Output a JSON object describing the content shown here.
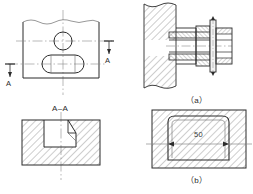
{
  "sheet": {
    "width": 253,
    "height": 194,
    "background": "#ffffff",
    "line_color": "#2b2b2b",
    "thin_line_color": "#6b6b6b",
    "center_line_color": "#8a8a8a",
    "hatch_color": "#555555"
  },
  "views": {
    "top_left": {
      "name": "front-view-with-section-marks",
      "section_arrow_labels": [
        "A",
        "A"
      ],
      "features": [
        "circular-hole",
        "obround-slot",
        "break-line-top"
      ]
    },
    "bottom_left": {
      "name": "section-view-A-A",
      "title": "A–A",
      "features": [
        "stepped-recess",
        "hatched-solid"
      ]
    },
    "top_right": {
      "name": "assembly-detail-a",
      "caption": "（a）",
      "features": [
        "wall-section",
        "bolt-shaft",
        "flange-head",
        "break-lines"
      ]
    },
    "bottom_right": {
      "name": "assembly-detail-b",
      "caption": "（b）",
      "dimension_label": "50",
      "features": [
        "hatched-block",
        "rounded-cavity",
        "centerline"
      ]
    }
  },
  "labels": {
    "section_a_left": "A",
    "section_a_right": "A",
    "section_title": "A–A",
    "caption_a": "（a）",
    "caption_b": "（b）",
    "dimension_50": "50"
  }
}
